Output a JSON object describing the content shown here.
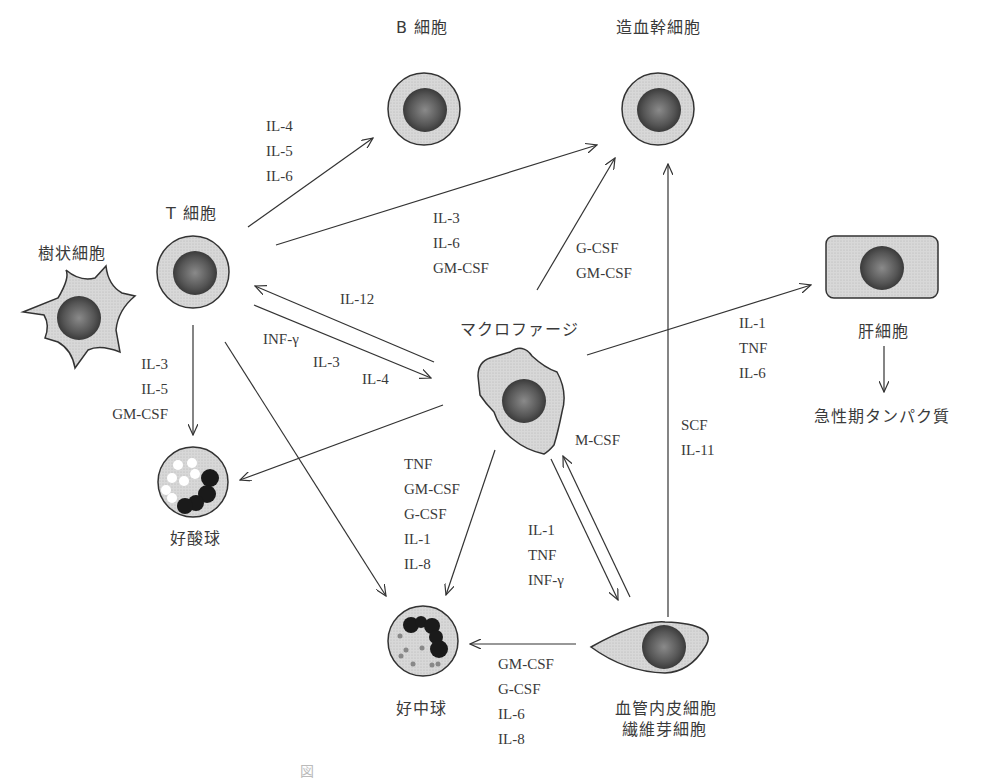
{
  "cells": {
    "b_cell": "B 細胞",
    "stem_cell": "造血幹細胞",
    "t_cell": "T 細胞",
    "dendritic_cell": "樹状細胞",
    "macrophage": "マクロファージ",
    "hepatocyte": "肝細胞",
    "acute_phase_protein": "急性期タンパク質",
    "eosinophil": "好酸球",
    "neutrophil": "好中球",
    "endothelial_line1": "血管内皮細胞",
    "endothelial_line2": "繊維芽細胞"
  },
  "edges": {
    "t_to_b": [
      "IL-4",
      "IL-5",
      "IL-6"
    ],
    "t_to_stem": [
      "IL-3",
      "IL-6",
      "GM-CSF"
    ],
    "macrophage_to_stem": [
      "G-CSF",
      "GM-CSF"
    ],
    "macrophage_to_t": [
      "IL-12"
    ],
    "t_to_macrophage": [
      "INF-γ",
      "IL-3",
      "IL-4"
    ],
    "t_to_eosinophil": [
      "IL-3",
      "IL-5",
      "GM-CSF"
    ],
    "macrophage_to_hepatocyte": [
      "IL-1",
      "TNF",
      "IL-6"
    ],
    "endothelial_to_stem": [
      "SCF",
      "IL-11"
    ],
    "endothelial_to_macrophage": [
      "M-CSF"
    ],
    "macrophage_to_neutrophil": [
      "TNF",
      "GM-CSF",
      "G-CSF",
      "IL-1",
      "IL-8"
    ],
    "macrophage_to_endothelial": [
      "IL-1",
      "TNF",
      "INF-γ"
    ],
    "endothelial_to_neutrophil": [
      "GM-CSF",
      "G-CSF",
      "IL-6",
      "IL-8"
    ]
  },
  "caption": "図"
}
